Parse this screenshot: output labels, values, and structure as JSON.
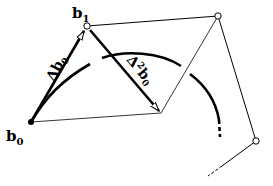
{
  "diagram": {
    "type": "bezier-control-polygon-differences",
    "colors": {
      "stroke": "#000000",
      "background": "#ffffff"
    },
    "points": {
      "b0": {
        "label": "b",
        "subscript": "0",
        "x": 31,
        "y": 122
      },
      "b1": {
        "label": "b",
        "subscript": "1",
        "x": 87,
        "y": 26
      },
      "b2": {
        "x": 218,
        "y": 16
      },
      "b3": {
        "x": 256,
        "y": 141
      },
      "mid": {
        "x": 161,
        "y": 113
      }
    },
    "vectors": [
      {
        "name": "delta-b0",
        "label_prefix": "Δ",
        "label_main": "b",
        "label_sub": "0",
        "from": "b0",
        "to": "b1"
      },
      {
        "name": "delta2-b0",
        "label_prefix": "Δ",
        "label_sup": "2",
        "label_main": "b",
        "label_sub": "0",
        "from": "b1",
        "to": "mid"
      }
    ],
    "curve": {
      "description": "arc starting at b0, continuing dashed beyond",
      "style": "thick"
    }
  }
}
